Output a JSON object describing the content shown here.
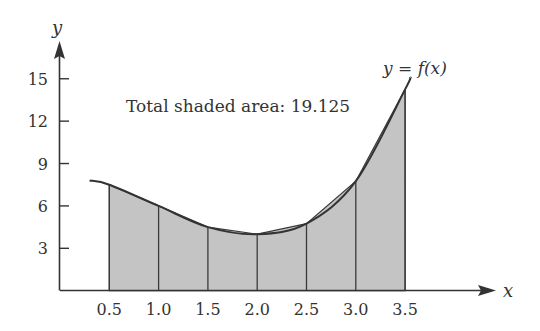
{
  "chart_data": {
    "type": "area",
    "title": "",
    "xlabel": "x",
    "ylabel": "y",
    "curve_label": "y = f(x)",
    "annotation": "Total shaded area: 19.125",
    "x_ticks": [
      "0.5",
      "1.0",
      "1.5",
      "2.0",
      "2.5",
      "3.0",
      "3.5"
    ],
    "y_ticks": [
      "3",
      "6",
      "9",
      "12",
      "15"
    ],
    "xlim": [
      0,
      4.4
    ],
    "ylim": [
      0,
      17
    ],
    "grid": false,
    "legend": null,
    "series": [
      {
        "name": "f(x)",
        "kind": "curve",
        "x": [
          0.3,
          0.5,
          1.0,
          1.5,
          2.0,
          2.5,
          3.0,
          3.5,
          3.55
        ],
        "y": [
          7.8,
          7.5,
          6.0,
          4.5,
          4.0,
          4.75,
          7.75,
          14.25,
          15.1
        ]
      },
      {
        "name": "trapezoids",
        "kind": "shaded",
        "x": [
          0.5,
          1.0,
          1.5,
          2.0,
          2.5,
          3.0,
          3.5
        ],
        "y": [
          7.5,
          6.0,
          4.5,
          4.0,
          4.75,
          7.75,
          14.25
        ]
      }
    ]
  },
  "colors": {
    "axis": "#333333",
    "curve": "#333333",
    "shade": "#c4c4c4",
    "divider": "#3a3a3a"
  }
}
